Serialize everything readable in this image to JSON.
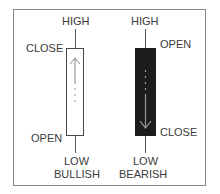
{
  "diagram": {
    "bullish": {
      "title": "BULLISH",
      "high_label": "HIGH",
      "low_label": "LOW",
      "close_label": "CLOSE",
      "open_label": "OPEN",
      "body_color": "#ffffff",
      "arrow_direction": "up"
    },
    "bearish": {
      "title": "BEARISH",
      "high_label": "HIGH",
      "low_label": "LOW",
      "open_label": "OPEN",
      "close_label": "CLOSE",
      "body_color": "#1c1c1c",
      "arrow_direction": "down"
    }
  }
}
